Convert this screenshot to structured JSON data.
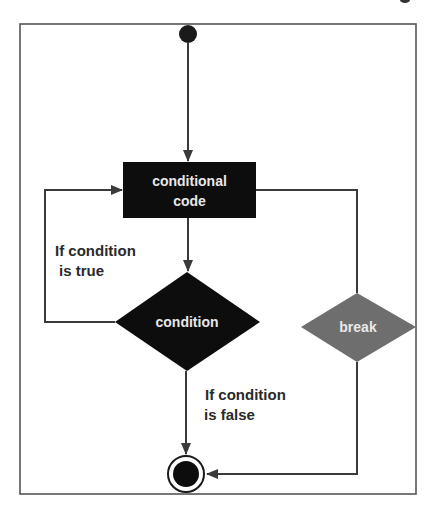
{
  "diagram": {
    "type": "flowchart",
    "title": "",
    "colors": {
      "frame": "#555555",
      "node_dark": "#0d0d0d",
      "node_break": "#6e6e6e",
      "edge": "#3a3a3a",
      "node_text": "#e8e8e8",
      "label_text": "#2a2a2a"
    },
    "nodes": {
      "start": {
        "kind": "initial-node"
      },
      "code": {
        "kind": "action",
        "line1": "conditional",
        "line2": "code"
      },
      "condition": {
        "kind": "decision",
        "label": "condition"
      },
      "break": {
        "kind": "decision",
        "label": "break"
      },
      "end": {
        "kind": "final-node"
      }
    },
    "edges": [
      {
        "from": "start",
        "to": "code"
      },
      {
        "from": "code",
        "to": "condition"
      },
      {
        "from": "condition",
        "to": "code",
        "label_line1": "If condition",
        "label_line2": "is true"
      },
      {
        "from": "condition",
        "to": "end",
        "label_line1": "If condition",
        "label_line2": "is false"
      },
      {
        "from": "code",
        "to": "break"
      },
      {
        "from": "break",
        "to": "end"
      }
    ],
    "labels": {
      "true_line1": "If condition",
      "true_line2": "is true",
      "false_line1": "If condition",
      "false_line2": "is false"
    }
  }
}
